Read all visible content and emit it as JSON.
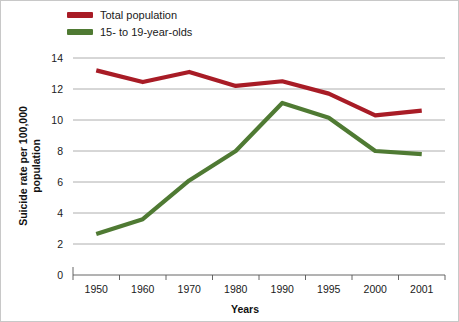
{
  "chart_data": {
    "type": "line",
    "title": "",
    "xlabel": "Years",
    "ylabel": "Suicide rate per 100,000 population",
    "categories": [
      "1950",
      "1960",
      "1970",
      "1980",
      "1990",
      "1995",
      "2000",
      "2001"
    ],
    "ylim": [
      0,
      14
    ],
    "yticks": [
      "0",
      "2",
      "4",
      "6",
      "8",
      "10",
      "12",
      "14"
    ],
    "grid": "horizontal",
    "legend_position": "top-left",
    "series": [
      {
        "name": "Total population",
        "color": "#A81C26",
        "values": [
          13.2,
          12.45,
          13.1,
          12.2,
          12.5,
          11.7,
          10.3,
          10.6
        ]
      },
      {
        "name": "15- to 19-year-olds",
        "color": "#4F7A33",
        "values": [
          2.65,
          3.6,
          6.1,
          8.0,
          11.1,
          10.15,
          8.0,
          7.8
        ]
      }
    ]
  },
  "legend": {
    "items": [
      {
        "label": "Total population",
        "swatch": "#A81C26"
      },
      {
        "label": "15- to 19-year-olds",
        "swatch": "#4F7A33"
      }
    ]
  },
  "axes": {
    "y_title": "Suicide rate per 100,000 population",
    "y_title_line1": "Suicide rate per 100,000",
    "y_title_line2": "population",
    "x_title": "Years"
  }
}
